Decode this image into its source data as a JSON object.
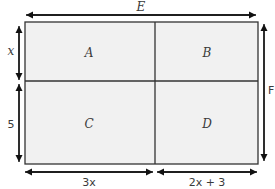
{
  "diagram": {
    "type": "area-rectangle",
    "colors": {
      "fill": "#f1f1f1",
      "stroke": "#333333",
      "arrow": "#111111",
      "text": "#3a3a3a"
    },
    "regions": [
      {
        "id": "A",
        "label": "A"
      },
      {
        "id": "B",
        "label": "B"
      },
      {
        "id": "C",
        "label": "C"
      },
      {
        "id": "D",
        "label": "D"
      }
    ],
    "dimensions": {
      "top": {
        "label": "E"
      },
      "right": {
        "label": "F"
      },
      "left_top": {
        "label": "x"
      },
      "left_bottom": {
        "label": "5"
      },
      "bottom_left": {
        "label": "3x"
      },
      "bottom_right": {
        "label": "2x + 3"
      }
    }
  }
}
